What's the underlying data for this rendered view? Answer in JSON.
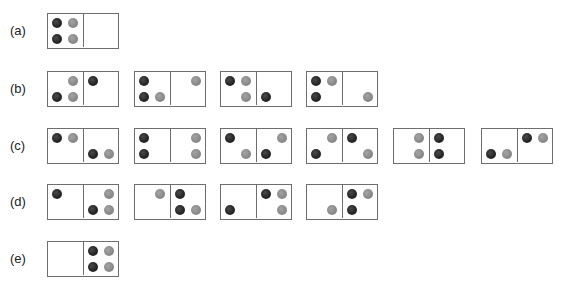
{
  "colors": {
    "dark": "#262626",
    "grey": "#8a8a8a",
    "border": "#6e6e6e"
  },
  "legend": {
    "d": "dark-ball",
    "g": "grey-ball",
    "_": "empty"
  },
  "rows": [
    {
      "label": "(a)",
      "top": 13,
      "cells": [
        {
          "left": 47,
          "L": [
            "d",
            "g",
            "d",
            "g"
          ],
          "R": [
            "_",
            "_",
            "_",
            "_"
          ]
        }
      ]
    },
    {
      "label": "(b)",
      "top": 71,
      "cells": [
        {
          "left": 47,
          "L": [
            "_",
            "g",
            "d",
            "g"
          ],
          "R": [
            "d",
            "_",
            "_",
            "_"
          ]
        },
        {
          "left": 134,
          "L": [
            "d",
            "_",
            "d",
            "g"
          ],
          "R": [
            "_",
            "g",
            "_",
            "_"
          ]
        },
        {
          "left": 220,
          "L": [
            "d",
            "g",
            "_",
            "g"
          ],
          "R": [
            "_",
            "_",
            "d",
            "_"
          ]
        },
        {
          "left": 306,
          "L": [
            "d",
            "g",
            "d",
            "_"
          ],
          "R": [
            "_",
            "_",
            "_",
            "g"
          ]
        }
      ]
    },
    {
      "label": "(c)",
      "top": 128,
      "cells": [
        {
          "left": 47,
          "L": [
            "d",
            "g",
            "_",
            "_"
          ],
          "R": [
            "_",
            "_",
            "d",
            "g"
          ]
        },
        {
          "left": 134,
          "L": [
            "d",
            "_",
            "d",
            "_"
          ],
          "R": [
            "_",
            "g",
            "_",
            "g"
          ]
        },
        {
          "left": 220,
          "L": [
            "d",
            "_",
            "_",
            "g"
          ],
          "R": [
            "_",
            "g",
            "d",
            "_"
          ]
        },
        {
          "left": 306,
          "L": [
            "_",
            "g",
            "d",
            "_"
          ],
          "R": [
            "d",
            "_",
            "_",
            "g"
          ]
        },
        {
          "left": 393,
          "L": [
            "_",
            "g",
            "_",
            "g"
          ],
          "R": [
            "d",
            "_",
            "d",
            "_"
          ]
        },
        {
          "left": 481,
          "L": [
            "_",
            "_",
            "d",
            "g"
          ],
          "R": [
            "d",
            "g",
            "_",
            "_"
          ]
        }
      ]
    },
    {
      "label": "(d)",
      "top": 184,
      "cells": [
        {
          "left": 47,
          "L": [
            "d",
            "_",
            "_",
            "_"
          ],
          "R": [
            "_",
            "g",
            "d",
            "g"
          ]
        },
        {
          "left": 134,
          "L": [
            "_",
            "g",
            "_",
            "_"
          ],
          "R": [
            "d",
            "_",
            "d",
            "g"
          ]
        },
        {
          "left": 220,
          "L": [
            "_",
            "_",
            "d",
            "_"
          ],
          "R": [
            "d",
            "g",
            "_",
            "g"
          ]
        },
        {
          "left": 306,
          "L": [
            "_",
            "_",
            "_",
            "g"
          ],
          "R": [
            "d",
            "g",
            "d",
            "_"
          ]
        }
      ]
    },
    {
      "label": "(e)",
      "top": 241,
      "cells": [
        {
          "left": 47,
          "L": [
            "_",
            "_",
            "_",
            "_"
          ],
          "R": [
            "d",
            "g",
            "d",
            "g"
          ]
        }
      ]
    }
  ]
}
